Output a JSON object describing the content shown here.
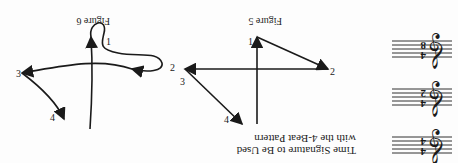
{
  "caption": {
    "line1": "Time Signature to Be Used",
    "line2": "with the 4-Beat Pattern"
  },
  "time_signatures": [
    {
      "top": "4",
      "bottom": "4",
      "clef": "treble-clef-icon"
    },
    {
      "top": "4",
      "bottom": "2",
      "clef": "treble-clef-icon"
    },
    {
      "top": "4",
      "bottom": "8",
      "clef": "treble-clef-icon"
    }
  ],
  "figure5": {
    "label": "Figure 5",
    "beats": [
      "1",
      "2",
      "3",
      "4"
    ]
  },
  "figure6": {
    "label": "Figure 6",
    "beats": [
      "1",
      "2",
      "3",
      "4"
    ]
  },
  "colors": {
    "ink": "#1a1a1a",
    "paper": "#fdfdfd"
  }
}
